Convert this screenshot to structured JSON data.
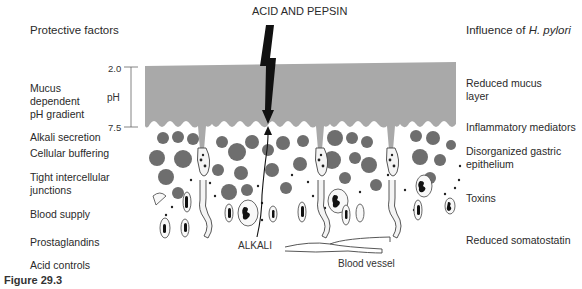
{
  "title_top": "ACID AND PEPSIN",
  "left_column": {
    "header": "Protective factors",
    "items": [
      {
        "label": "Mucus\ndependent\npH gradient"
      },
      {
        "label": "Alkali secretion"
      },
      {
        "label": "Cellular buffering"
      },
      {
        "label": "Tight intercellular\njunctions"
      },
      {
        "label": "Blood supply"
      },
      {
        "label": "Prostaglandins"
      },
      {
        "label": "Acid controls"
      }
    ]
  },
  "right_column": {
    "header_prefix": "Influence of ",
    "header_italic": "H. pylori",
    "items": [
      {
        "label": "Reduced mucus\nlayer"
      },
      {
        "label": "Inflammatory mediators"
      },
      {
        "label": "Disorganized gastric\nepithelium"
      },
      {
        "label": "Toxins"
      },
      {
        "label": "Reduced somatostatin"
      }
    ]
  },
  "ph_scale": {
    "axis_label": "pH",
    "top_value": "2.0",
    "bottom_value": "7.5"
  },
  "annotations": {
    "alkali": "ALKALI",
    "blood_vessel": "Blood vessel"
  },
  "caption": "Figure 29.3",
  "colors": {
    "mucus_layer": "#a9a9a9",
    "cell_granule": "#6e6e6e",
    "text": "#2a2a2a"
  }
}
